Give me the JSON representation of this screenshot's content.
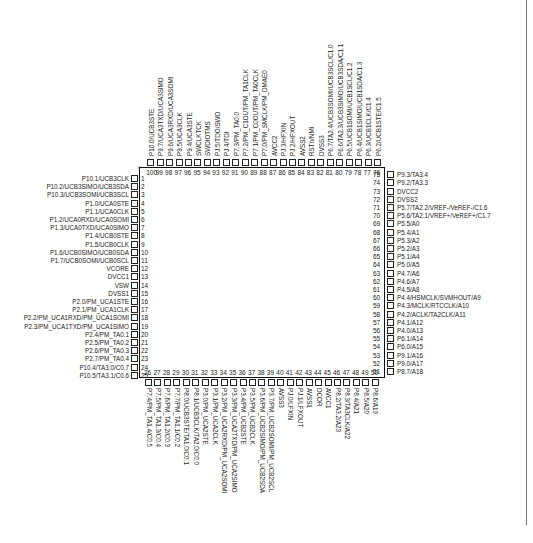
{
  "diagram": {
    "type": "ic-pinout",
    "package_pins": 100,
    "pin1_marker": "○",
    "left_pins": [
      {
        "num": "1",
        "label": "P10.1/UCB3CLK"
      },
      {
        "num": "2",
        "label": "P10.2/UCB3SIMO/UCB3SDA"
      },
      {
        "num": "3",
        "label": "P10.3/UCB3SOMI/UCB3SCL"
      },
      {
        "num": "4",
        "label": "P1.0/UCA0STE"
      },
      {
        "num": "5",
        "label": "P1.1/UCA0CLK"
      },
      {
        "num": "6",
        "label": "P1.2/UCA0RXD/UCA0SOMI"
      },
      {
        "num": "7",
        "label": "P1.3/UCA0TXD/UCA0SIMO"
      },
      {
        "num": "8",
        "label": "P1.4/UCB0STE"
      },
      {
        "num": "9",
        "label": "P1.5/UCB0CLK"
      },
      {
        "num": "10",
        "label": "P1.6/UCB0SIMO/UCB0SDA"
      },
      {
        "num": "11",
        "label": "P1.7/UCB0SOMI/UCB0SCL"
      },
      {
        "num": "12",
        "label": "VCORE"
      },
      {
        "num": "13",
        "label": "DVCC1"
      },
      {
        "num": "14",
        "label": "VSW"
      },
      {
        "num": "15",
        "label": "DVSS1"
      },
      {
        "num": "16",
        "label": "P2.0/PM_UCA1STE"
      },
      {
        "num": "17",
        "label": "P2.1/PM_UCA1CLK"
      },
      {
        "num": "18",
        "label": "P2.2/PM_UCA1RXD/PM_UCA1SOMI"
      },
      {
        "num": "19",
        "label": "P2.3/PM_UCA1TXD/PM_UCA1SIMO"
      },
      {
        "num": "20",
        "label": "P2.4/PM_TA0.1"
      },
      {
        "num": "21",
        "label": "P2.5/PM_TA0.2"
      },
      {
        "num": "22",
        "label": "P2.6/PM_TA0.3"
      },
      {
        "num": "23",
        "label": "P2.7/PM_TA0.4"
      },
      {
        "num": "24",
        "label": "P10.4/TA3.0/C0.7"
      },
      {
        "num": "25",
        "label": "P10.5/TA3.1/C0.6"
      }
    ],
    "bottom_pins": [
      {
        "num": "26",
        "label": "P7.4/PM_TA1.4/C0.5"
      },
      {
        "num": "27",
        "label": "P7.5/PM_TA1.3/C0.4"
      },
      {
        "num": "28",
        "label": "P7.6/PM_TA1.2/C0.3"
      },
      {
        "num": "29",
        "label": "P7.7/PM_TA1.1/C0.2"
      },
      {
        "num": "30",
        "label": "P8.0/UCB3STE/TA1.0/C0.1"
      },
      {
        "num": "31",
        "label": "P8.1/UCB3CLK/TA2.0/C0.0"
      },
      {
        "num": "32",
        "label": "P3.0/PM_UCA2STE"
      },
      {
        "num": "33",
        "label": "P3.1/PM_UCA2CLK"
      },
      {
        "num": "34",
        "label": "P3.2/PM_UCA2RXD/PM_UCA2SOMI"
      },
      {
        "num": "35",
        "label": "P3.3/PM_UCA2TXD/PM_UCA2SIMO"
      },
      {
        "num": "36",
        "label": "P3.4/PM_UCB2STE"
      },
      {
        "num": "37",
        "label": "P3.5/PM_UCB2CLK"
      },
      {
        "num": "38",
        "label": "P3.6/PM_UCB2SIMO/PM_UCB2SDA"
      },
      {
        "num": "39",
        "label": "P3.7/PM_UCB2SOMI/PM_UCB2SCL"
      },
      {
        "num": "40",
        "label": "AVSS3"
      },
      {
        "num": "41",
        "label": "PJ.0/LFXIN"
      },
      {
        "num": "42",
        "label": "PJ.1/LFXOUT"
      },
      {
        "num": "43",
        "label": "AVSS1"
      },
      {
        "num": "44",
        "label": "DCOR"
      },
      {
        "num": "45",
        "label": "AVCC1"
      },
      {
        "num": "46",
        "label": "P8.2/TA3.2/A23"
      },
      {
        "num": "47",
        "label": "P8.3/TA3CLK/A22"
      },
      {
        "num": "48",
        "label": "P8.4/A21"
      },
      {
        "num": "49",
        "label": "P8.5/A20"
      },
      {
        "num": "50",
        "label": "P8.6/A19"
      }
    ],
    "right_pins": [
      {
        "num": "51",
        "label": "P8.7/A18"
      },
      {
        "num": "52",
        "label": "P9.0/A17"
      },
      {
        "num": "53",
        "label": "P9.1/A16"
      },
      {
        "num": "54",
        "label": "P6.0/A15"
      },
      {
        "num": "55",
        "label": "P6.1/A14"
      },
      {
        "num": "56",
        "label": "P4.0/A13"
      },
      {
        "num": "57",
        "label": "P4.1/A12"
      },
      {
        "num": "58",
        "label": "P4.2/ACLK/TA2CLK/A11"
      },
      {
        "num": "59",
        "label": "P4.3/MCLK/RTCCLK/A10"
      },
      {
        "num": "60",
        "label": "P4.4/HSMCLK/SVMHOUT/A9"
      },
      {
        "num": "61",
        "label": "P4.5/A8"
      },
      {
        "num": "62",
        "label": "P4.6/A7"
      },
      {
        "num": "63",
        "label": "P4.7/A6"
      },
      {
        "num": "64",
        "label": "P5.0/A5"
      },
      {
        "num": "65",
        "label": "P5.1/A4"
      },
      {
        "num": "66",
        "label": "P5.2/A3"
      },
      {
        "num": "67",
        "label": "P5.3/A2"
      },
      {
        "num": "68",
        "label": "P5.4/A1"
      },
      {
        "num": "69",
        "label": "P5.5/A0"
      },
      {
        "num": "70",
        "label": "P5.6/TA2.1/VREF+/VeREF+/C1.7"
      },
      {
        "num": "71",
        "label": "P5.7/TA2.2/VREF-/VeREF-/C1.6"
      },
      {
        "num": "72",
        "label": "DVSS2"
      },
      {
        "num": "73",
        "label": "DVCC2"
      },
      {
        "num": "74",
        "label": "P9.2/TA3.3"
      },
      {
        "num": "75",
        "label": "P9.3/TA3.4"
      }
    ],
    "top_pins": [
      {
        "num": "76",
        "label": "P6.2/UCB1STE/C1.5"
      },
      {
        "num": "77",
        "label": "P6.3/UCB1CLK/C1.4"
      },
      {
        "num": "78",
        "label": "P6.4/UCB1SIMO/UCB1SDA/C1.3"
      },
      {
        "num": "79",
        "label": "P6.5/UCB1SOMI/UCB1SCL/C1.2"
      },
      {
        "num": "80",
        "label": "P6.6/TA2.3/UCB3SIMO/UCB3SDA/C1.1"
      },
      {
        "num": "81",
        "label": "P6.7/TA2.4/UCB3SOMI/UCB3SCL/C1.0"
      },
      {
        "num": "82",
        "label": "DVSS3"
      },
      {
        "num": "83",
        "label": "RSTn/NMI"
      },
      {
        "num": "84",
        "label": "AVSS2"
      },
      {
        "num": "85",
        "label": "PJ.2/HFXOUT"
      },
      {
        "num": "86",
        "label": "PJ.3/HFXIN"
      },
      {
        "num": "87",
        "label": "AVCC2"
      },
      {
        "num": "88",
        "label": "P7.0/PM_SMCLK/PM_DMAE0"
      },
      {
        "num": "89",
        "label": "P7.1/PM_C0OUT/PM_TA0CLK"
      },
      {
        "num": "90",
        "label": "P7.2/PM_C1OUT/PM_TA1CLK"
      },
      {
        "num": "91",
        "label": "P7.3/PM_TA0.0"
      },
      {
        "num": "92",
        "label": "PJ.4/TDI"
      },
      {
        "num": "93",
        "label": "PJ.5/TDO/SWO"
      },
      {
        "num": "94",
        "label": "SWDIOTMS"
      },
      {
        "num": "95",
        "label": "SWCLKTCK"
      },
      {
        "num": "96",
        "label": "P9.4/UCA3STE"
      },
      {
        "num": "97",
        "label": "P9.5/UCA3CLK"
      },
      {
        "num": "98",
        "label": "P9.6/UCA3RXD/UCA3SOMI"
      },
      {
        "num": "99",
        "label": "P9.7/UCA3TXD/UCA3SIMO"
      },
      {
        "num": "100",
        "label": "P10.0/UCB3STE"
      }
    ]
  }
}
